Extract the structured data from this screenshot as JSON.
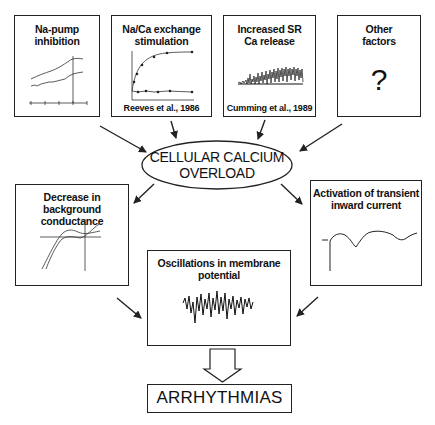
{
  "diagram": {
    "center_node": {
      "line1": "CELLULAR CALCIUM",
      "line2": "OVERLOAD"
    },
    "causes": [
      {
        "title_line1": "Na-pump",
        "title_line2": "inhibition",
        "citation": ""
      },
      {
        "title_line1": "Na/Ca exchange",
        "title_line2": "stimulation",
        "citation": "Reeves et al., 1986"
      },
      {
        "title_line1": "Increased SR",
        "title_line2": "Ca release",
        "citation": "Cumming et al., 1989"
      },
      {
        "title_line1": "Other",
        "title_line2": "factors",
        "citation": "",
        "symbol": "?"
      }
    ],
    "effects": [
      {
        "title_line1": "Decrease in background",
        "title_line2": "conductance"
      },
      {
        "title_line1": "Activation of transient",
        "title_line2": "inward current"
      },
      {
        "title_line1": "Oscillations in membrane",
        "title_line2": "potential"
      }
    ],
    "outcome": {
      "label": "ARRHYTHMIAS"
    },
    "colors": {
      "stroke": "#222222",
      "background": "#ffffff"
    }
  }
}
